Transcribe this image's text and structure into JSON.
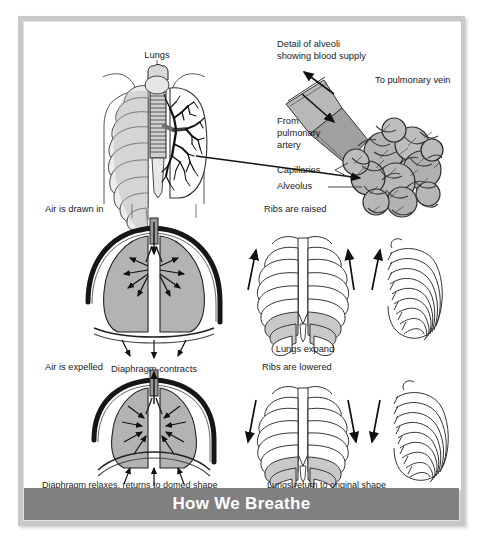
{
  "poster": {
    "caption_title": "How We Breathe",
    "frame_color": "#c8c8c8",
    "caption_bar_color": "#808080",
    "caption_text_color": "#ffffff",
    "background_color": "#ffffff",
    "line_color": "#1a1a1a",
    "organ_fill_color": "#b3b3b3",
    "vessel_fill_color": "#9a9a9a"
  },
  "labels": {
    "lungs": "Lungs",
    "detail_line1": "Detail of alveoli",
    "detail_line2": "showing blood supply",
    "to_pulmonary_vein": "To pulmonary vein",
    "from_line1": "From",
    "from_line2": "pulmonary",
    "from_line3": "artery",
    "capillaries": "Capillaries",
    "alveolus": "Alveolus",
    "air_drawn_in": "Air is drawn in",
    "ribs_raised": "Ribs are raised",
    "diaphragm_contracts": "Diaphragm contracts",
    "lungs_expand": "Lungs expand",
    "air_expelled": "Air is expelled",
    "ribs_lowered": "Ribs are lowered",
    "diaphragm_relaxes": "Diaphragm relaxes, returns to domed shape",
    "lungs_return": "Lungs return to original shape"
  },
  "figure": {
    "type": "anatomical-diagram",
    "panels": [
      {
        "id": "torso-lungs",
        "title": "Lungs",
        "description": "Front view of human torso outline with rib cage, trachea, bronchial tree and lungs"
      },
      {
        "id": "alveoli-detail",
        "title": "Detail of alveoli showing blood supply",
        "description": "Magnified cluster of alveoli with capillary network, pulmonary artery inflow and pulmonary vein outflow",
        "callouts": [
          "To pulmonary vein",
          "From pulmonary artery",
          "Capillaries",
          "Alveolus"
        ]
      },
      {
        "id": "inhalation",
        "title": "Air is drawn in",
        "sub_labels": [
          "Diaphragm contracts",
          "Ribs are raised",
          "Lungs expand"
        ],
        "description": "Inhalation: lungs inflate, arrows point outward, diaphragm flattens downward, ribs move up"
      },
      {
        "id": "exhalation",
        "title": "Air is expelled",
        "sub_labels": [
          "Diaphragm relaxes, returns to domed shape",
          "Ribs are lowered",
          "Lungs return to original shape"
        ],
        "description": "Exhalation: lungs deflate, arrows point inward, diaphragm domes upward, ribs move down"
      }
    ]
  }
}
